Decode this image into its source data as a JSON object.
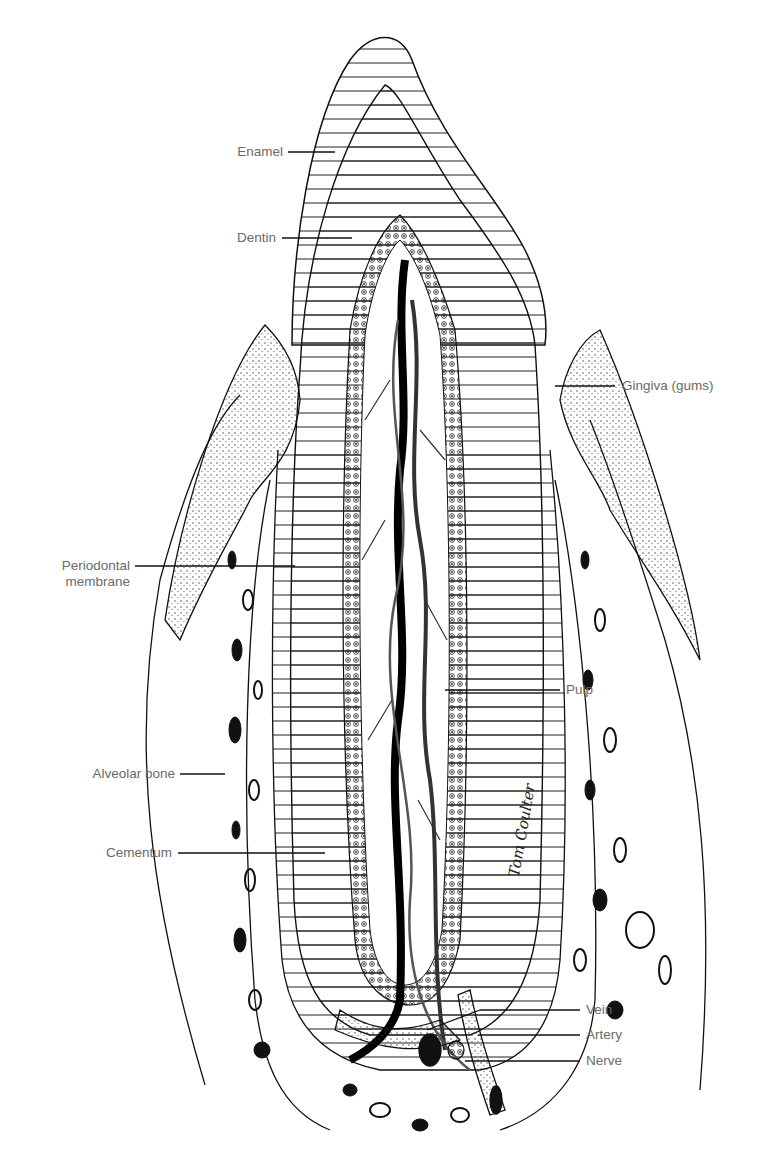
{
  "figure": {
    "labels": {
      "enamel": "Enamel",
      "dentin": "Dentin",
      "gingiva": "Gingiva (gums)",
      "periodontal_1": "Periodontal",
      "periodontal_2": "membrane",
      "pulp": "Pulp",
      "alveolar": "Alveolar bone",
      "cementum": "Cementum",
      "vein": "Vein",
      "artery": "Artery",
      "nerve": "Nerve"
    },
    "signature": "Tom Coulter"
  }
}
